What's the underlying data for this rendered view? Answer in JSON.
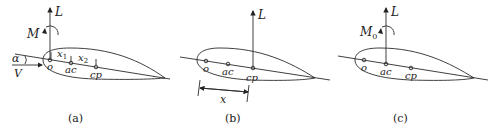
{
  "panels": [
    {
      "id": "a",
      "caption": "(a)",
      "lift_label": "L",
      "moment_label": "M",
      "moment_subscript": "",
      "angle_label": "α",
      "velocity_label": "V",
      "dim1_label": "x",
      "dim1_sub": "1",
      "dim2_label": "x",
      "dim2_sub": "2",
      "points": [
        {
          "label": "o"
        },
        {
          "label": "ac"
        },
        {
          "label": "cp"
        }
      ]
    },
    {
      "id": "b",
      "caption": "(b)",
      "lift_label": "L",
      "distance_label": "x",
      "points": [
        {
          "label": "o"
        },
        {
          "label": "ac"
        },
        {
          "label": "cp"
        }
      ]
    },
    {
      "id": "c",
      "caption": "(c)",
      "lift_label": "L",
      "moment_label": "M",
      "moment_subscript": "0",
      "points": [
        {
          "label": "o"
        },
        {
          "label": "ac"
        },
        {
          "label": "cp"
        }
      ]
    }
  ]
}
